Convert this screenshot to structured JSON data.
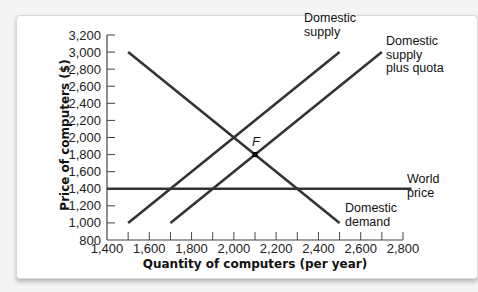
{
  "chart_data": {
    "type": "line",
    "title": "",
    "xlabel": "Quantity of computers (per year)",
    "ylabel": "Price of computers ($)",
    "xlim": [
      1400,
      2800
    ],
    "ylim": [
      800,
      3200
    ],
    "grid": false,
    "x_ticks": [
      "1,400",
      "1,600",
      "1,800",
      "2,000",
      "2,200",
      "2,400",
      "2,600",
      "2,800"
    ],
    "y_ticks": [
      "800",
      "1,000",
      "1,200",
      "1,400",
      "1,600",
      "1,800",
      "2,000",
      "2,200",
      "2,400",
      "2,600",
      "2,800",
      "3,000",
      "3,200"
    ],
    "series": [
      {
        "name": "Domestic supply",
        "label_lines": [
          "Domestic",
          "supply"
        ],
        "points": [
          [
            1500,
            1000
          ],
          [
            2500,
            3000
          ]
        ]
      },
      {
        "name": "Domestic supply plus quota",
        "label_lines": [
          "Domestic",
          "supply",
          "plus quota"
        ],
        "points": [
          [
            1700,
            1000
          ],
          [
            2700,
            3000
          ]
        ]
      },
      {
        "name": "Domestic demand",
        "label_lines": [
          "Domestic",
          "demand"
        ],
        "points": [
          [
            1500,
            3000
          ],
          [
            2500,
            1000
          ]
        ]
      },
      {
        "name": "World price",
        "label_lines": [
          "World",
          "price"
        ],
        "points": [
          [
            1400,
            1400
          ],
          [
            2840,
            1400
          ]
        ]
      }
    ],
    "annotations": [
      {
        "label": "F",
        "x": 2100,
        "y": 1800
      }
    ]
  },
  "colors": {
    "line": "#333333",
    "axis": "#444444"
  }
}
